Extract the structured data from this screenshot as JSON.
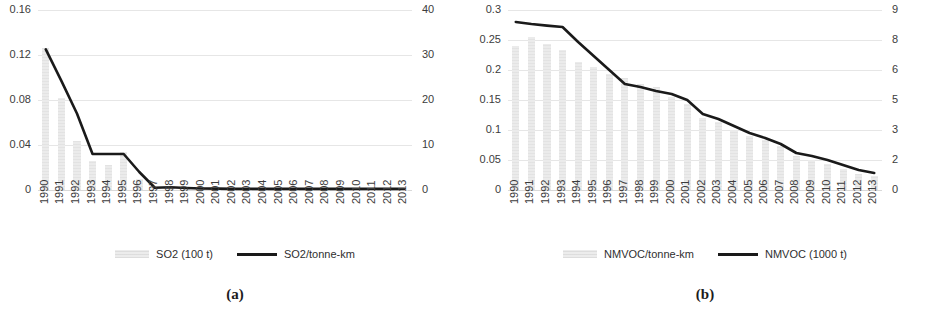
{
  "figure": {
    "panels": [
      {
        "caption": "(a)",
        "legend": [
          {
            "label": "SO2 (100 t)",
            "marker": "bar-swatch"
          },
          {
            "label": "SO2/tonne-km",
            "marker": "line-swatch"
          }
        ],
        "chart_data": {
          "type": "bar",
          "title": "",
          "xlabel": "",
          "ylabel": "",
          "grid": true,
          "legend_position": "bottom",
          "categories": [
            "1990",
            "1991",
            "1992",
            "1993",
            "1994",
            "1995",
            "1996",
            "1997",
            "1998",
            "1999",
            "2000",
            "2001",
            "2002",
            "2003",
            "2004",
            "2005",
            "2006",
            "2007",
            "2008",
            "2009",
            "2010",
            "2011",
            "2012",
            "2013"
          ],
          "left_axis": {
            "name": "SO2/tonne-km",
            "ylim": [
              0,
              0.16
            ],
            "ticks": [
              "0",
              "0.04",
              "0.08",
              "0.12",
              "0.16"
            ],
            "tick_values": [
              0,
              0.04,
              0.08,
              0.12,
              0.16
            ]
          },
          "right_axis": {
            "name": "SO2 (100 t)",
            "ylim": [
              0,
              40
            ],
            "ticks": [
              "0",
              "10",
              "20",
              "30",
              "40"
            ],
            "tick_values": [
              0,
              10,
              20,
              30,
              40
            ]
          },
          "series": [
            {
              "name": "SO2 (100 t)",
              "chart_type": "bar",
              "axis": "right",
              "color": "#ebebeb",
              "values": [
                31.5,
                20.5,
                11.0,
                6.5,
                5.5,
                8.5,
                2.5,
                0.4,
                0.3,
                0.2,
                0.15,
                0.12,
                0.1,
                0.1,
                0.1,
                0.1,
                0.1,
                0.1,
                0.1,
                0.1,
                0.1,
                0.1,
                0.1,
                0.1
              ]
            },
            {
              "name": "SO2/tonne-km",
              "chart_type": "line",
              "axis": "left",
              "color": "#1a1a1a",
              "values": [
                0.125,
                0.097,
                0.068,
                0.032,
                0.032,
                0.032,
                0.016,
                0.002,
                0.0025,
                0.0018,
                0.0014,
                0.0012,
                0.001,
                0.001,
                0.001,
                0.001,
                0.001,
                0.001,
                0.001,
                0.001,
                0.001,
                0.001,
                0.001,
                0.001
              ]
            }
          ]
        }
      },
      {
        "caption": "(b)",
        "legend": [
          {
            "label": "NMVOC/tonne-km",
            "marker": "bar-swatch"
          },
          {
            "label": "NMVOC (1000 t)",
            "marker": "line-swatch"
          }
        ],
        "chart_data": {
          "type": "bar",
          "title": "",
          "xlabel": "",
          "ylabel": "",
          "grid": true,
          "legend_position": "bottom",
          "categories": [
            "1990",
            "1991",
            "1992",
            "1993",
            "1994",
            "1995",
            "1996",
            "1997",
            "1998",
            "1999",
            "2000",
            "2001",
            "2002",
            "2003",
            "2004",
            "2005",
            "2006",
            "2007",
            "2008",
            "2009",
            "2010",
            "2011",
            "2012",
            "2013"
          ],
          "left_axis": {
            "name": "NMVOC/tonne-km",
            "ylim": [
              0,
              0.3
            ],
            "ticks": [
              "0",
              "0.05",
              "0.1",
              "0.15",
              "0.2",
              "0.25",
              "0.3"
            ],
            "tick_values": [
              0,
              0.05,
              0.1,
              0.15,
              0.2,
              0.25,
              0.3
            ]
          },
          "right_axis": {
            "name": "NMVOC (1000 t)",
            "ylim": [
              0,
              9
            ],
            "ticks": [
              "0",
              "2",
              "3",
              "5",
              "6",
              "8",
              "9"
            ],
            "tick_values": [
              0,
              1.5,
              3,
              4.5,
              6,
              7.5,
              9
            ]
          },
          "series": [
            {
              "name": "NMVOC/tonne-km",
              "chart_type": "bar",
              "axis": "left",
              "color": "#ebebeb",
              "values": [
                0.24,
                0.255,
                0.243,
                0.234,
                0.214,
                0.205,
                0.194,
                0.187,
                0.177,
                0.172,
                0.155,
                0.143,
                0.12,
                0.113,
                0.1,
                0.09,
                0.083,
                0.073,
                0.057,
                0.05,
                0.043,
                0.035,
                0.027,
                0.023
              ]
            },
            {
              "name": "NMVOC (1000 t)",
              "chart_type": "line",
              "axis": "right",
              "color": "#1a1a1a",
              "values": [
                8.4,
                8.3,
                8.22,
                8.15,
                7.4,
                6.7,
                6.0,
                5.3,
                5.15,
                4.95,
                4.8,
                4.5,
                3.8,
                3.55,
                3.2,
                2.85,
                2.6,
                2.3,
                1.85,
                1.7,
                1.5,
                1.25,
                1.0,
                0.85
              ]
            }
          ]
        }
      }
    ]
  }
}
